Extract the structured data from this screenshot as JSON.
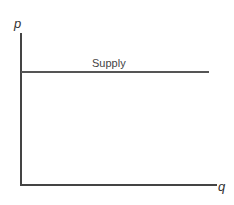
{
  "chart_data": {
    "type": "line",
    "title": "",
    "xlabel": "q",
    "ylabel": "p",
    "grid": false,
    "legend": null,
    "series": [
      {
        "name": "Supply",
        "x": [
          0,
          1
        ],
        "y": [
          0.74,
          0.74
        ],
        "style": "horizontal line (perfectly elastic supply)"
      }
    ],
    "annotations": [
      {
        "text": "Supply",
        "position": "above line, center"
      }
    ],
    "xlim": [
      0,
      1
    ],
    "ylim": [
      0,
      1
    ]
  },
  "labels": {
    "y_axis": "p",
    "x_axis": "q",
    "supply": "Supply"
  }
}
